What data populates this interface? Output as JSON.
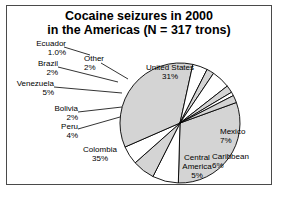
{
  "chart_data": {
    "type": "pie",
    "title": "Cocaine seizures in 2000 in the Americas (N = 317 trons)",
    "title_lines": [
      "Cocaine seizures in 2000",
      "in the Americas (N = 317 trons)"
    ],
    "unit": "percent",
    "total_label": "N = 317 trons",
    "categories": [
      "United States",
      "Mexico",
      "Caribbean",
      "Central America",
      "Colombia",
      "Peru",
      "Bolivia",
      "Venezuela",
      "Brazil",
      "Ecuador",
      "Other"
    ],
    "values": [
      31,
      7,
      6,
      5,
      35,
      4,
      2,
      5,
      2,
      1.0,
      2
    ],
    "value_labels": [
      "31%",
      "7%",
      "6%",
      "5%",
      "35%",
      "4%",
      "2%",
      "5%",
      "2%",
      "1.0%",
      "2%"
    ],
    "slice_colors": [
      "#d4d4d4",
      "#ffffff",
      "#d4d4d4",
      "#ffffff",
      "#d4d4d4",
      "#ffffff",
      "#d4d4d4",
      "#ffffff",
      "#d4d4d4",
      "#ffffff",
      "#d4d4d4"
    ],
    "outline_color": "#000000",
    "legend": "none",
    "labels_position": "outside-with-leader-lines",
    "start_angle_deg": -20,
    "direction": "clockwise"
  },
  "labels": {
    "united_states": {
      "name": "United States",
      "value": "31%"
    },
    "mexico": {
      "name": "Mexico",
      "value": "7%"
    },
    "caribbean": {
      "name": "Caribbean",
      "value": "6%"
    },
    "central_america_l1": "Central",
    "central_america_l2": "America",
    "central_america_value": "5%",
    "colombia": {
      "name": "Colombia",
      "value": "35%"
    },
    "peru": {
      "name": "Peru",
      "value": "4%"
    },
    "bolivia": {
      "name": "Bolivia",
      "value": "2%"
    },
    "venezuela": {
      "name": "Venezuela",
      "value": "5%"
    },
    "brazil": {
      "name": "Brazil",
      "value": "2%"
    },
    "ecuador": {
      "name": "Ecuador",
      "value": "1.0%"
    },
    "other": {
      "name": "Other",
      "value": "2%"
    }
  }
}
